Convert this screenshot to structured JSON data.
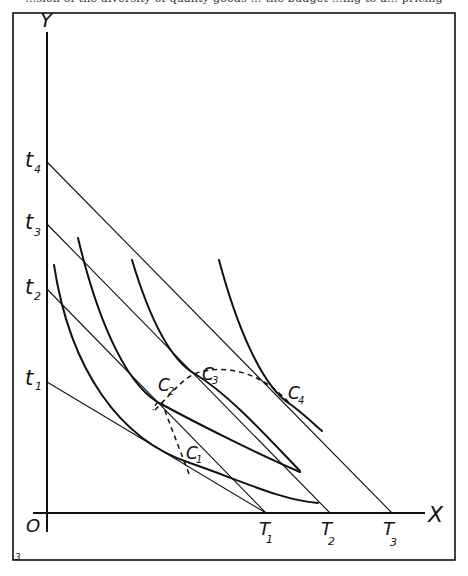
{
  "caption_fragment": "…sion of the diversity of quality goods … the budget …ing to a… pricing",
  "figure_number": "3",
  "axes": {
    "x_label": "X",
    "y_label": "Y",
    "origin_label": "O"
  },
  "y_intercepts": [
    {
      "id": "t1",
      "label": "t",
      "sub": "1",
      "y": 382
    },
    {
      "id": "t2",
      "label": "t",
      "sub": "2",
      "y": 289
    },
    {
      "id": "t3",
      "label": "t",
      "sub": "3",
      "y": 224
    },
    {
      "id": "t4",
      "label": "t",
      "sub": "4",
      "y": 162
    }
  ],
  "x_intercepts": [
    {
      "id": "T1",
      "label": "T",
      "sub": "1",
      "x": 266
    },
    {
      "id": "T2",
      "label": "T",
      "sub": "2",
      "x": 330
    },
    {
      "id": "T3",
      "label": "T",
      "sub": "3",
      "x": 392
    }
  ],
  "tangency_points": [
    {
      "id": "C1",
      "label": "C",
      "sub": "1"
    },
    {
      "id": "C2",
      "label": "C",
      "sub": "2"
    },
    {
      "id": "C3",
      "label": "C",
      "sub": "3"
    },
    {
      "id": "C4",
      "label": "C",
      "sub": "4"
    }
  ],
  "colors": {
    "ink": "#111111",
    "background": "#ffffff"
  }
}
